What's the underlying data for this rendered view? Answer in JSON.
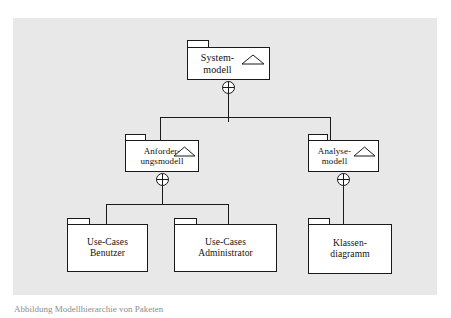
{
  "figure": {
    "kind": "uml-package-diagram",
    "language": "de",
    "background_color": "#ffffff",
    "panel_color": "#e8e8e8",
    "line_color": "#1a1a1a",
    "box_fill": "#ffffff",
    "caption": "Abbildung  Modellhierarchie von Paketen"
  },
  "packages": {
    "systemmodell": {
      "label": "System-\nmodell",
      "line1": "System-",
      "line2": "modell",
      "marker": "triangle-icon",
      "has_marker": true
    },
    "anforderungsmodell": {
      "label": "Anforder-\nungsmodell",
      "line1": "Anforder-",
      "line2": "ungsmodell",
      "marker": "triangle-icon",
      "has_marker": true
    },
    "analysemodell": {
      "label": "Analyse-\nmodell",
      "line1": "Analyse-",
      "line2": "modell",
      "marker": "triangle-icon",
      "has_marker": true
    },
    "usecases_benutzer": {
      "label": "Use-Cases\nBenutzer",
      "line1": "Use-Cases",
      "line2": "Benutzer",
      "has_marker": false
    },
    "usecases_administrator": {
      "label": "Use-Cases\nAdministrator",
      "line1": "Use-Cases",
      "line2": "Administrator",
      "has_marker": false
    },
    "klassendiagramm": {
      "label": "Klassen-\ndiagramm",
      "line1": "Klassen-",
      "line2": "diagramm",
      "has_marker": false
    }
  },
  "relations": [
    {
      "from": "systemmodell",
      "to": "anforderungsmodell",
      "type": "containment"
    },
    {
      "from": "systemmodell",
      "to": "analysemodell",
      "type": "containment"
    },
    {
      "from": "anforderungsmodell",
      "to": "usecases_benutzer",
      "type": "containment"
    },
    {
      "from": "anforderungsmodell",
      "to": "usecases_administrator",
      "type": "containment"
    },
    {
      "from": "analysemodell",
      "to": "klassendiagramm",
      "type": "containment"
    }
  ]
}
